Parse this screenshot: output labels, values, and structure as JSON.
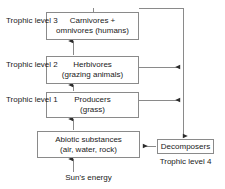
{
  "diagram": {
    "stroke_color": "#8a8a8a",
    "text_color": "#1a1a1a",
    "nodes": {
      "carnivores": {
        "line1": "Carnivores +",
        "line2": "omnivores (humans)"
      },
      "herbivores": {
        "line1": "Herbivores",
        "line2": "(grazing animals)"
      },
      "producers": {
        "line1": "Producers",
        "line2": "(grass)"
      },
      "abiotic": {
        "line1": "Abiotic substances",
        "line2": "(air, water, rock)"
      },
      "decomposers": {
        "line1": "Decomposers"
      }
    },
    "labels": {
      "level3": {
        "line1": "Trophic",
        "line2": "level 3"
      },
      "level2": {
        "line1": "Trophic",
        "line2": "level 2"
      },
      "level1": {
        "line1": "Trophic",
        "line2": "level 1"
      },
      "level4": {
        "line1": "Trophic",
        "line2": "level 4"
      },
      "sun": "Sun's energy"
    },
    "flows": [
      {
        "from": "sun",
        "to": "abiotic",
        "direction": "up"
      },
      {
        "from": "abiotic",
        "to": "producers",
        "direction": "up"
      },
      {
        "from": "producers",
        "to": "herbivores",
        "direction": "up"
      },
      {
        "from": "herbivores",
        "to": "carnivores",
        "direction": "up"
      },
      {
        "from": "producers",
        "to": "decomposers",
        "direction": "right"
      },
      {
        "from": "herbivores",
        "to": "decomposers",
        "direction": "right"
      },
      {
        "from": "carnivores",
        "to": "decomposers",
        "direction": "right"
      },
      {
        "from": "decomposers",
        "to": "abiotic",
        "direction": "left"
      }
    ]
  }
}
